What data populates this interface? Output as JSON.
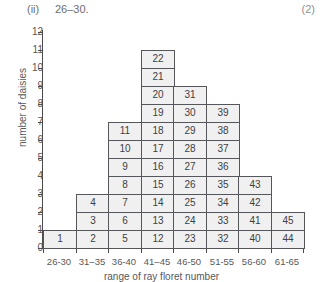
{
  "header": {
    "question_number": "(ii)",
    "answer": "26–30.",
    "marks": "(2)"
  },
  "chart_data": {
    "type": "bar",
    "title": "",
    "xlabel": "range of ray floret number",
    "ylabel": "number of daisies",
    "categories": [
      "26-30",
      "31–35",
      "36-40",
      "41–45",
      "46-50",
      "51-55",
      "56-60",
      "61-65"
    ],
    "values": [
      1,
      4,
      7,
      11,
      9,
      8,
      4,
      2
    ],
    "ylim": [
      0,
      12
    ],
    "yticks": [
      0,
      1,
      2,
      3,
      4,
      5,
      6,
      7,
      8,
      9,
      10,
      11,
      12
    ],
    "ytick_labels": [
      "0",
      "1",
      "2",
      "3",
      "4",
      "5",
      "6",
      "7",
      "8",
      "9",
      "10",
      "11",
      "12"
    ],
    "grid": false,
    "legend": null,
    "cell_labels": [
      [
        "1"
      ],
      [
        "2",
        "3",
        "4"
      ],
      [
        "5",
        "6",
        "7",
        "8",
        "9",
        "10",
        "11"
      ],
      [
        "12",
        "13",
        "14",
        "15",
        "16",
        "17",
        "18",
        "19",
        "20",
        "21",
        "22"
      ],
      [
        "23",
        "24",
        "25",
        "26",
        "27",
        "28",
        "29",
        "30",
        "31"
      ],
      [
        "32",
        "33",
        "34",
        "35",
        "36",
        "37",
        "38",
        "39"
      ],
      [
        "40",
        "41",
        "42",
        "43"
      ],
      [
        "44",
        "45"
      ]
    ],
    "cell_fill_color": "#f0f0f0",
    "cell_border_color": "#55565a",
    "axis_color": "#4a4a4c",
    "text_color": "#58585a"
  }
}
